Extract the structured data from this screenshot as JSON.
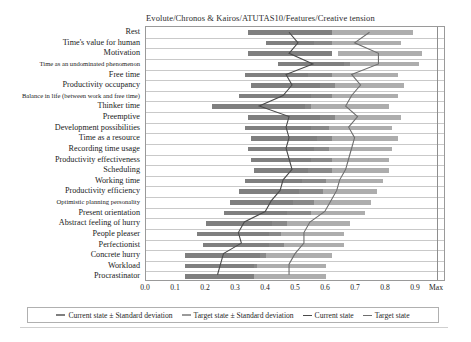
{
  "chart_data": {
    "type": "bar",
    "title": "Evolute/Chronos & Kairos/ATUTAS10/Features/Creative tension",
    "xlabel": "",
    "ylabel": "",
    "xlim": [
      0.0,
      1.0
    ],
    "grid": true,
    "orientation": "horizontal",
    "legend_position": "bottom",
    "xticks": [
      "0.0",
      "0.1",
      "0.2",
      "0.3",
      "0.4",
      "0.5",
      "0.6",
      "0.7",
      "0.8",
      "0.9",
      "Max"
    ],
    "xtick_values": [
      0.0,
      0.1,
      0.2,
      0.3,
      0.4,
      0.5,
      0.6,
      0.7,
      0.8,
      0.9,
      1.0
    ],
    "categories": [
      "Rest",
      "Time's value for human",
      "Motivation",
      "Time as an undominated phenomenon",
      "Free time",
      "Productivity occupancy",
      "Balance in life (between work and free time)",
      "Thinker time",
      "Preemptive",
      "Development possibilities",
      "Time as a resource",
      "Recording time usage",
      "Productivity effectiveness",
      "Scheduling",
      "Working time",
      "Productivity efficiency",
      "Optimistic planning personality",
      "Present orientation",
      "Abstract feeling of hurry",
      "People pleaser",
      "Perfectionist",
      "Concrete hurry",
      "Workload",
      "Procrastinator"
    ],
    "series": [
      {
        "name": "Current state ± Standard deviation",
        "type": "range_bar",
        "color": "#7f7f7f",
        "low": [
          0.34,
          0.4,
          0.34,
          0.44,
          0.33,
          0.35,
          0.31,
          0.22,
          0.34,
          0.33,
          0.35,
          0.34,
          0.35,
          0.36,
          0.33,
          0.31,
          0.28,
          0.26,
          0.2,
          0.17,
          0.19,
          0.13,
          0.13,
          0.13
        ],
        "high": [
          0.62,
          0.62,
          0.62,
          0.68,
          0.62,
          0.63,
          0.62,
          0.55,
          0.63,
          0.61,
          0.62,
          0.61,
          0.62,
          0.62,
          0.6,
          0.59,
          0.56,
          0.55,
          0.47,
          0.45,
          0.46,
          0.4,
          0.37,
          0.36
        ]
      },
      {
        "name": "Target state ± Standard deviation",
        "type": "range_bar",
        "color": "#8d8d8d",
        "low": [
          0.62,
          0.56,
          0.64,
          0.66,
          0.54,
          0.58,
          0.55,
          0.53,
          0.58,
          0.55,
          0.57,
          0.56,
          0.55,
          0.54,
          0.52,
          0.51,
          0.49,
          0.47,
          0.42,
          0.41,
          0.41,
          0.38,
          0.36,
          0.36
        ],
        "high": [
          0.89,
          0.85,
          0.92,
          0.91,
          0.84,
          0.86,
          0.84,
          0.81,
          0.85,
          0.82,
          0.84,
          0.82,
          0.81,
          0.81,
          0.79,
          0.77,
          0.75,
          0.73,
          0.68,
          0.66,
          0.66,
          0.62,
          0.6,
          0.6
        ]
      },
      {
        "name": "Current state",
        "type": "line",
        "color": "#4a4a4a",
        "values": [
          0.48,
          0.51,
          0.48,
          0.56,
          0.47,
          0.49,
          0.46,
          0.38,
          0.48,
          0.47,
          0.48,
          0.47,
          0.48,
          0.49,
          0.46,
          0.45,
          0.42,
          0.4,
          0.33,
          0.31,
          0.32,
          0.26,
          0.25,
          0.24
        ]
      },
      {
        "name": "Target state",
        "type": "line",
        "color": "#6e6e6e",
        "values": [
          0.75,
          0.7,
          0.78,
          0.78,
          0.69,
          0.72,
          0.69,
          0.67,
          0.71,
          0.68,
          0.7,
          0.69,
          0.68,
          0.67,
          0.65,
          0.64,
          0.62,
          0.6,
          0.55,
          0.53,
          0.53,
          0.5,
          0.48,
          0.48
        ]
      }
    ]
  },
  "legend": {
    "items": [
      {
        "label": "Current state ± Standard deviation",
        "marker": "band-current"
      },
      {
        "label": "Target state ± Standard deviation",
        "marker": "band-target"
      },
      {
        "label": "Current state",
        "marker": "line-current"
      },
      {
        "label": "Target state",
        "marker": "line-target"
      }
    ]
  },
  "colors": {
    "bar_current": "#7f7f7f",
    "bar_target": "#8d8d8d",
    "line_current": "#4a4a4a",
    "line_target": "#6e6e6e",
    "grid": "#c9c9c9",
    "frame": "#9a9a9a"
  }
}
